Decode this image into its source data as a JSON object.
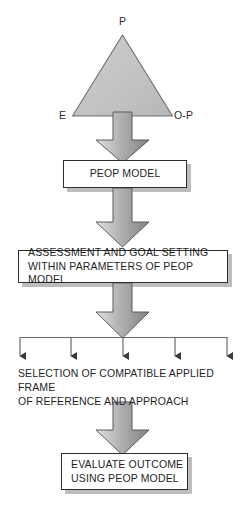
{
  "diagram": {
    "type": "flowchart",
    "canvas": {
      "width": 250,
      "height": 507
    },
    "colors": {
      "triangle_fill": "#c3c3c3",
      "triangle_stroke": "#6e6e6e",
      "arrow_light": "#e2e2e2",
      "arrow_mid": "#b0b0b0",
      "arrow_dark": "#7d7d7d",
      "arrow_stroke": "#5a5a5a",
      "box_fill": "#ffffff",
      "box_stroke": "#2e2e2e",
      "box_shadow": "#bdbdbd",
      "text": "#1f1f1f",
      "line": "#6b6b6b"
    }
  },
  "triangle": {
    "name": "PEOP triangle",
    "apex_label": "P",
    "left_label": "E",
    "right_label": "O-P"
  },
  "nodes": {
    "peop_model": "PEOP MODEL",
    "assessment": "ASSESSMENT AND GOAL SETTING\nWITHIN PARAMETERS OF PEOP MODEL",
    "selection": "SELECTION OF COMPATIBLE APPLIED FRAME\nOF REFERENCE AND APPROACH",
    "evaluate": "EVALUATE OUTCOME\nUSING PEOP MODEL"
  },
  "branches": {
    "count": 5,
    "tick_positions": [
      20,
      71,
      123,
      175,
      227
    ]
  },
  "arrows": {
    "block_arrow_count": 4,
    "direction": "down"
  }
}
